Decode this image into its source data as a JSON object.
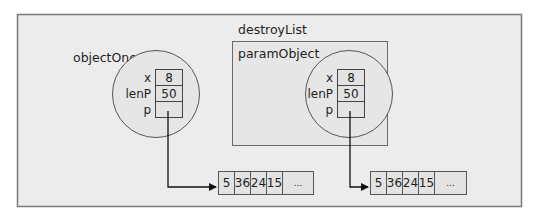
{
  "diagram": {
    "frame": {
      "background": "#ececec",
      "border": "#7a7a7a"
    },
    "objectOne": {
      "label": "objectOne",
      "fields": [
        {
          "name": "x",
          "value": "8"
        },
        {
          "name": "lenP",
          "value": "50"
        },
        {
          "name": "p",
          "value": ""
        }
      ]
    },
    "destroyList": {
      "label": "destroyList",
      "paramObject": {
        "label": "paramObject",
        "fields": [
          {
            "name": "x",
            "value": "8"
          },
          {
            "name": "lenP",
            "value": "50"
          },
          {
            "name": "p",
            "value": ""
          }
        ]
      }
    },
    "array1": {
      "cells": [
        "5",
        "36",
        "24",
        "15",
        "..."
      ]
    },
    "array2": {
      "cells": [
        "5",
        "36",
        "24",
        "15",
        "..."
      ]
    }
  }
}
